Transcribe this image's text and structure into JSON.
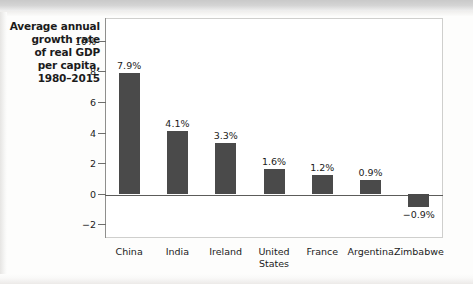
{
  "figure": {
    "title_lines": [
      "Average annual",
      "growth rate",
      "of real GDP",
      "per capita,",
      "1980–2015"
    ],
    "bar_color": "#4a4a4a",
    "frame_color": "#cfcfcd",
    "axis_color": "#5c5c5a"
  },
  "artifacts": {
    "bleed_1": "ııı",
    "bleed_2": "ıı",
    "bleed_3": "",
    "bleed_4": ""
  },
  "chart_data": {
    "type": "bar",
    "title": "Average annual growth rate of real GDP per capita, 1980–2015",
    "xlabel": "",
    "ylabel": "",
    "categories": [
      "China",
      "India",
      "Ireland",
      "United States",
      "France",
      "Argentina",
      "Zimbabwe"
    ],
    "category_labels": [
      "China",
      "India",
      "Ireland",
      "United\nStates",
      "France",
      "Argentina",
      "Zimbabwe"
    ],
    "values": [
      7.9,
      4.1,
      3.3,
      1.6,
      1.2,
      0.9,
      -0.9
    ],
    "value_labels": [
      "7.9%",
      "4.1%",
      "3.3%",
      "1.6%",
      "1.2%",
      "0.9%",
      "−0.9%"
    ],
    "ylim": [
      -2.9,
      11.5
    ],
    "yticks": [
      10,
      8,
      6,
      4,
      2,
      0,
      -2
    ],
    "ytick_labels": [
      "10%",
      "8",
      "6",
      "4",
      "2",
      "0",
      "−2"
    ],
    "grid": false,
    "legend": null,
    "zero_line": true
  }
}
